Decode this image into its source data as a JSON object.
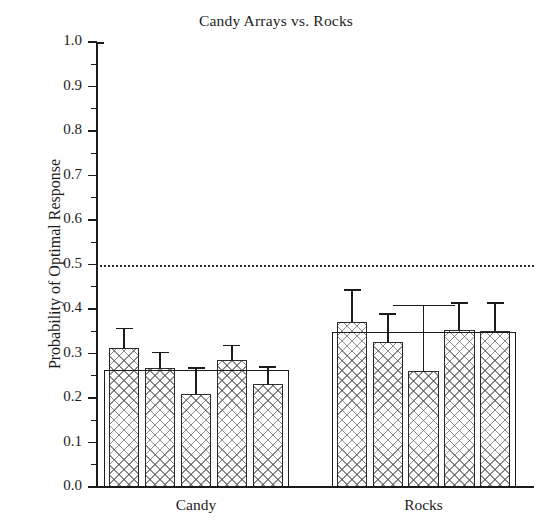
{
  "chart_data": {
    "type": "bar",
    "title": "Candy Arrays vs. Rocks",
    "xlabel": "",
    "ylabel": "Probability of Optimal Response",
    "ylim": [
      0.0,
      1.0
    ],
    "ytick_labels": [
      "0.0",
      "0.1",
      "0.2",
      "0.3",
      "0.4",
      "0.5",
      "0.6",
      "0.7",
      "0.8",
      "0.9",
      "1.0"
    ],
    "ytick_values": [
      0.0,
      0.1,
      0.2,
      0.3,
      0.4,
      0.5,
      0.6,
      0.7,
      0.8,
      0.9,
      1.0
    ],
    "yminor_values": [
      0.05,
      0.15,
      0.25,
      0.35,
      0.45,
      0.55,
      0.65,
      0.75,
      0.85,
      0.95
    ],
    "grid": false,
    "legend": "none",
    "reference_line": {
      "value": 0.5,
      "style": "dotted",
      "label": ""
    },
    "categories": [
      "Candy",
      "Rocks"
    ],
    "groups": [
      {
        "name": "Candy",
        "group_mean": 0.262,
        "subjects": [
          {
            "label": "1",
            "value": 0.313,
            "error": 0.045
          },
          {
            "label": "2",
            "value": 0.268,
            "error": 0.036
          },
          {
            "label": "3",
            "value": 0.21,
            "error": 0.06
          },
          {
            "label": "4",
            "value": 0.285,
            "error": 0.035
          },
          {
            "label": "5",
            "value": 0.232,
            "error": 0.04
          }
        ]
      },
      {
        "name": "Rocks",
        "group_mean": 0.348,
        "subjects": [
          {
            "label": "1",
            "value": 0.37,
            "error": 0.075
          },
          {
            "label": "2",
            "value": 0.325,
            "error": 0.065
          },
          {
            "label": "3",
            "value": 0.26,
            "error": 0.15
          },
          {
            "label": "4",
            "value": 0.353,
            "error": 0.063
          },
          {
            "label": "5",
            "value": 0.35,
            "error": 0.065
          }
        ]
      }
    ]
  },
  "colors": {
    "axis": "#1b1b1b",
    "bar_edge": "#2b2b2b",
    "bar_hatch": "#464646",
    "bar_fill": "#ffffff",
    "reference_line": "#2a2a2a",
    "text": "#1c1c1c",
    "background": "#ffffff"
  }
}
